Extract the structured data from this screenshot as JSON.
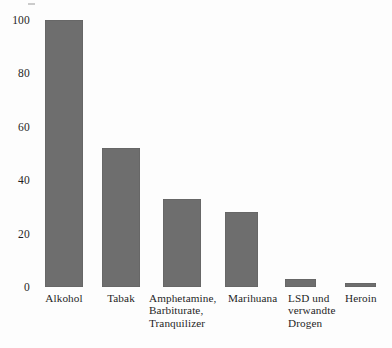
{
  "chart_data": {
    "type": "bar",
    "title": "",
    "subtitle": "",
    "xlabel": "",
    "ylabel": "",
    "ylim": [
      0,
      100
    ],
    "yticks": [
      0,
      20,
      40,
      60,
      80,
      100
    ],
    "grid": false,
    "legend": "none",
    "orientation": "vertical",
    "bar_color": "#6e6e6e",
    "categories": [
      "Alkohol",
      "Tabak",
      "Amphetamine,\nBarbiturate,\nTranquilizer",
      "Marihuana",
      "LSD und\nverwandte\nDrogen",
      "Heroin"
    ],
    "values": [
      100,
      52,
      33,
      28,
      3,
      1.5
    ],
    "bars": [
      {
        "label": "Alkohol",
        "value": 100,
        "x": 45,
        "width": 38,
        "label_x": 40,
        "label_width": 48,
        "align": "center"
      },
      {
        "label": "Tabak",
        "value": 52,
        "x": 102,
        "width": 38,
        "label_x": 98,
        "label_width": 46,
        "align": "center"
      },
      {
        "label": "Amphetamine,\nBarbiturate,\nTranquilizer",
        "value": 33,
        "x": 163,
        "width": 38,
        "label_x": 149,
        "label_width": 80,
        "align": "left"
      },
      {
        "label": "Marihuana",
        "value": 28,
        "x": 225,
        "width": 33,
        "label_x": 228,
        "label_width": 62,
        "align": "left"
      },
      {
        "label": "LSD und\nverwandte\nDrogen",
        "value": 3,
        "x": 285,
        "width": 31,
        "label_x": 288,
        "label_width": 58,
        "align": "left"
      },
      {
        "label": "Heroin",
        "value": 1.5,
        "x": 345,
        "width": 31,
        "label_x": 345,
        "label_width": 44,
        "align": "left"
      }
    ]
  }
}
